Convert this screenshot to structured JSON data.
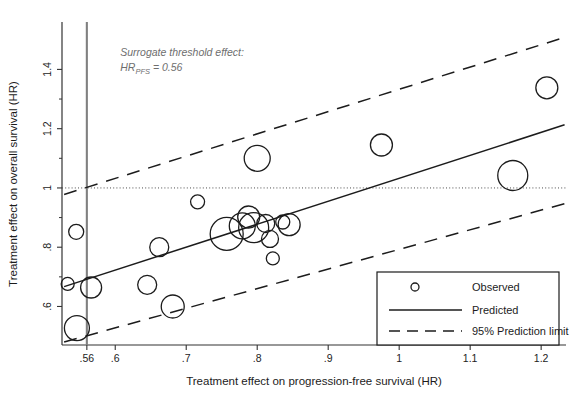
{
  "chart_data": {
    "type": "scatter",
    "title": "",
    "xlabel": "Treatment effect on progression-free survival (HR)",
    "ylabel": "Treatment effect on overall survival (HR)",
    "xlim": [
      0.525,
      1.235
    ],
    "ylim": [
      0.47,
      1.56
    ],
    "xticks": [
      0.56,
      0.6,
      0.7,
      0.8,
      0.9,
      1.0,
      1.1,
      1.2
    ],
    "xtick_labels": [
      ".56",
      ".6",
      ".7",
      ".8",
      ".9",
      "1",
      "1.1",
      "1.2"
    ],
    "yticks": [
      0.6,
      0.8,
      1.0,
      1.2,
      1.4
    ],
    "ytick_labels": [
      ".6",
      ".8",
      "1",
      "1.2",
      "1.4"
    ],
    "y_minor_ticks": [
      0.7,
      0.9,
      1.1,
      1.3
    ],
    "grid": false,
    "legend_position": "bottom-right",
    "reference_line_y": 1.0,
    "threshold_line_x": 0.56,
    "threshold_line_color": "#808080",
    "series": [
      {
        "name": "Observed",
        "type": "bubble",
        "points": [
          {
            "x": 0.545,
            "y": 0.852,
            "size": 7.5
          },
          {
            "x": 0.533,
            "y": 0.676,
            "size": 6.5
          },
          {
            "x": 0.566,
            "y": 0.664,
            "size": 10.5
          },
          {
            "x": 0.546,
            "y": 0.527,
            "size": 12.5
          },
          {
            "x": 0.645,
            "y": 0.673,
            "size": 9.5
          },
          {
            "x": 0.662,
            "y": 0.8,
            "size": 9.5
          },
          {
            "x": 0.681,
            "y": 0.6,
            "size": 11.5
          },
          {
            "x": 0.716,
            "y": 0.953,
            "size": 7.0
          },
          {
            "x": 0.757,
            "y": 0.845,
            "size": 16.5
          },
          {
            "x": 0.779,
            "y": 0.872,
            "size": 13.0
          },
          {
            "x": 0.788,
            "y": 0.902,
            "size": 11.0
          },
          {
            "x": 0.795,
            "y": 0.866,
            "size": 15.0
          },
          {
            "x": 0.8,
            "y": 1.1,
            "size": 13.0
          },
          {
            "x": 0.812,
            "y": 0.88,
            "size": 9.0
          },
          {
            "x": 0.818,
            "y": 0.828,
            "size": 8.5
          },
          {
            "x": 0.822,
            "y": 0.762,
            "size": 6.5
          },
          {
            "x": 0.836,
            "y": 0.885,
            "size": 7.0
          },
          {
            "x": 0.845,
            "y": 0.876,
            "size": 11.0
          },
          {
            "x": 0.975,
            "y": 1.145,
            "size": 11.0
          },
          {
            "x": 1.16,
            "y": 1.042,
            "size": 15.0
          },
          {
            "x": 1.208,
            "y": 1.338,
            "size": 11.0
          }
        ]
      },
      {
        "name": "Predicted",
        "type": "line",
        "style": "solid",
        "x": [
          0.528,
          1.233
        ],
        "y": [
          0.667,
          1.213
        ]
      },
      {
        "name": "95% Prediction limit (upper)",
        "type": "line",
        "style": "dashed",
        "x": [
          0.528,
          1.233
        ],
        "y": [
          0.978,
          1.508
        ]
      },
      {
        "name": "95% Prediction limit (lower)",
        "type": "line",
        "style": "dashed",
        "x": [
          0.528,
          1.233
        ],
        "y": [
          0.48,
          0.947
        ]
      }
    ],
    "annotations": [
      {
        "name": "surrogate-threshold-annotation",
        "line1": "Surrogate threshold effect:",
        "line2_prefix": "HR",
        "line2_sub": "PFS",
        "line2_suffix": " = 0.56",
        "x": 0.607,
        "y": 1.445
      }
    ],
    "legend": [
      {
        "label": "Observed",
        "marker": "circle"
      },
      {
        "label": "Predicted",
        "marker": "solid-line"
      },
      {
        "label": "95% Prediction limit",
        "marker": "dashed-line"
      }
    ]
  }
}
